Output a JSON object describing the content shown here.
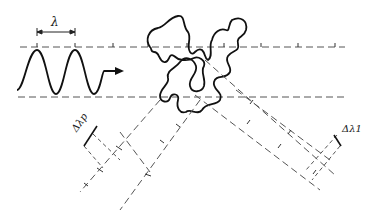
{
  "diagram": {
    "labels": {
      "wavelength": "λ",
      "delta_lambda_p": "Δλp",
      "delta_lambda_1": "Δλ1"
    },
    "colors": {
      "line": "#222222",
      "dashed": "#555555",
      "background": "#ffffff"
    }
  }
}
